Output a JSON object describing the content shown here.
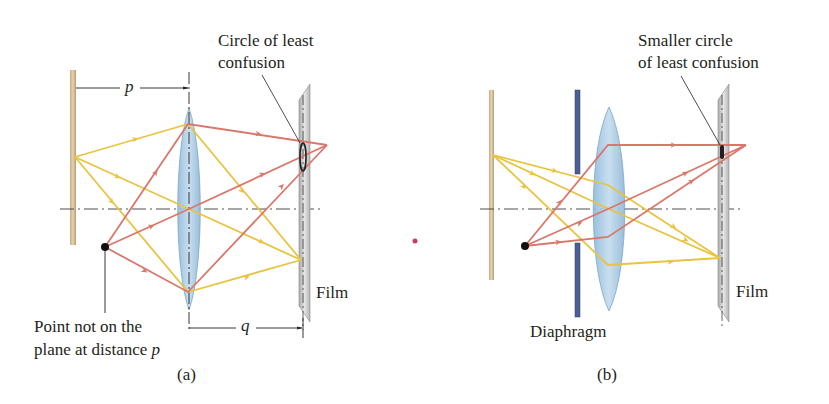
{
  "figure": {
    "panel_a": {
      "caption": "(a)",
      "callout_line1": "Circle of least",
      "callout_line2": "confusion",
      "distance_p": "p",
      "distance_q": "q",
      "point_label_line1": "Point not on the",
      "point_label_line2_prefix": "plane at distance ",
      "point_label_line2_var": "p",
      "film_label": "Film"
    },
    "panel_b": {
      "caption": "(b)",
      "callout_line1": "Smaller circle",
      "callout_line2": "of least confusion",
      "diaphragm_label": "Diaphragm",
      "film_label": "Film"
    },
    "colors": {
      "yellow_ray": "#e8c440",
      "red_ray": "#d9776a",
      "lens_fill": "#9cc4de",
      "lens_stroke": "#6f9fc4",
      "diaphragm": "#4a5f94",
      "wall": "#d9c3a0",
      "film": "#c9c9c9",
      "separator_dot": "#c04060"
    }
  }
}
